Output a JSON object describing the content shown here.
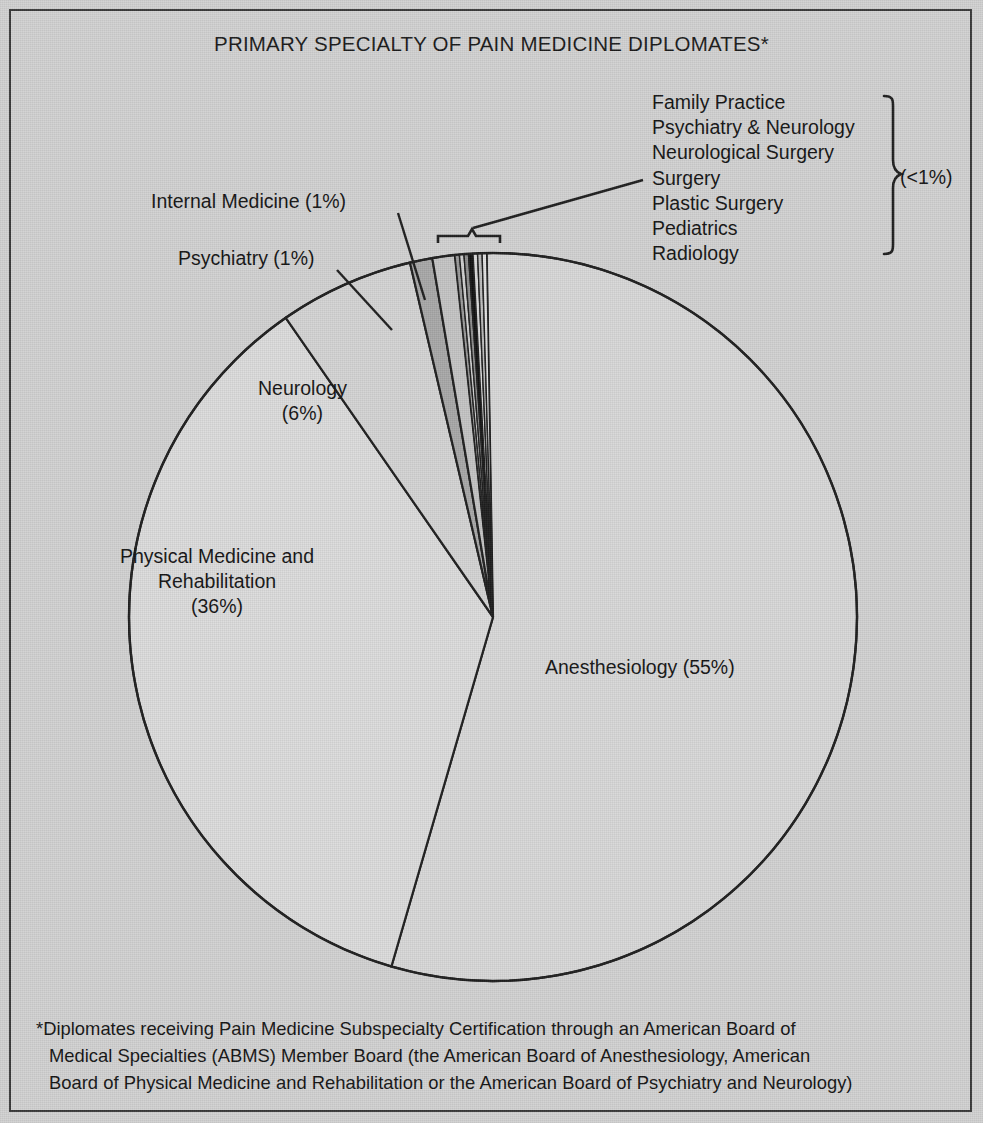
{
  "figure": {
    "title": "PRIMARY SPECIALTY OF PAIN MEDICINE DIPLOMATES*",
    "background_color": "#d2d2d2",
    "frame_color": "#3a3a3a"
  },
  "labels": {
    "internal_medicine": "Internal Medicine (1%)",
    "psychiatry": "Psychiatry (1%)",
    "neurology_l1": "Neurology",
    "neurology_l2": "(6%)",
    "pmr_l1": "Physical Medicine and",
    "pmr_l2": "Rehabilitation",
    "pmr_l3": "(36%)",
    "anesthesiology": "Anesthesiology (55%)"
  },
  "legend": {
    "bracket_note": "(<1%)",
    "items": [
      "Family Practice",
      "Psychiatry & Neurology",
      "Neurological Surgery",
      "Surgery",
      "Plastic Surgery",
      "Pediatrics",
      "Radiology"
    ]
  },
  "footnote": {
    "line1": "*Diplomates receiving Pain Medicine Subspecialty Certification through an American Board of",
    "line2": "Medical Specialties (ABMS) Member Board (the American Board of Anesthesiology, American",
    "line3": "Board of Physical Medicine and Rehabilitation or the American Board of Psychiatry and Neurology)"
  },
  "chart_data": {
    "type": "pie",
    "title": "PRIMARY SPECIALTY OF PAIN MEDICINE DIPLOMATES*",
    "units": "percent",
    "total": 100,
    "legend_position": "callout-labels-and-right-bracket",
    "categories": [
      "Anesthesiology",
      "Physical Medicine and Rehabilitation",
      "Neurology",
      "Psychiatry",
      "Internal Medicine",
      "Family Practice",
      "Psychiatry & Neurology",
      "Neurological Surgery",
      "Surgery",
      "Plastic Surgery",
      "Pediatrics",
      "Radiology"
    ],
    "values": [
      55,
      36,
      6,
      1,
      1,
      0.2,
      0.2,
      0.2,
      0.2,
      0.2,
      0.2,
      0.2
    ],
    "value_labels": [
      "55%",
      "36%",
      "6%",
      "1%",
      "1%",
      "<1%",
      "<1%",
      "<1%",
      "<1%",
      "<1%",
      "<1%",
      "<1%"
    ],
    "slice_colors": [
      "#d8d8d8",
      "#dcdcdc",
      "#d4d4d4",
      "#a8a8a8",
      "#c4c4c4",
      "#9a9a9a",
      "#cfcfcf",
      "#8e8e8e",
      "#111111",
      "#dadada",
      "#bdbdbd",
      "#e2e2e2"
    ],
    "annotations": [
      "Internal Medicine (1%)",
      "Psychiatry (1%)",
      "Neurology (6%)",
      "Physical Medicine and Rehabilitation (36%)",
      "Anesthesiology (55%)",
      "(<1%)"
    ],
    "footnote": "*Diplomates receiving Pain Medicine Subspecialty Certification through an American Board of Medical Specialties (ABMS) Member Board (the American Board of Anesthesiology, American Board of Physical Medicine and Rehabilitation or the American Board of Psychiatry and Neurology)"
  }
}
